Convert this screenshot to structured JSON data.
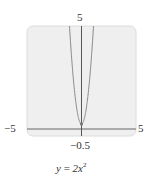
{
  "chart_data": {
    "type": "line",
    "equation": "y = 2x^2",
    "xlabel": "",
    "ylabel": "",
    "xlim": [
      -5,
      5
    ],
    "ylim": [
      -0.5,
      5
    ],
    "grid": false,
    "legend": null,
    "tick_labels": {
      "x_min": "−5",
      "x_max": "5",
      "y_min": "−0.5",
      "y_max": "5"
    },
    "series": [
      {
        "name": "y = 2x²",
        "x": [
          -1.581,
          -1.5,
          -1.25,
          -1.0,
          -0.75,
          -0.5,
          -0.25,
          0,
          0.25,
          0.5,
          0.75,
          1.0,
          1.25,
          1.5,
          1.581
        ],
        "y": [
          5.0,
          4.5,
          3.125,
          2.0,
          1.125,
          0.5,
          0.125,
          0,
          0.125,
          0.5,
          1.125,
          2.0,
          3.125,
          4.5,
          5.0
        ]
      }
    ],
    "annotations": [
      {
        "type": "point",
        "x": 0,
        "y": 0,
        "label": "vertex"
      }
    ]
  },
  "labels": {
    "y_max": "5",
    "x_min": "−5",
    "x_max": "5",
    "y_min": "−0.5"
  },
  "caption": {
    "var": "y",
    "op": " = ",
    "coef": "2x",
    "exp": "2"
  },
  "colors": {
    "plot_background": "#efefef",
    "plot_border": "#d8d8d8",
    "axis": "#666666",
    "curve": "#888888"
  }
}
